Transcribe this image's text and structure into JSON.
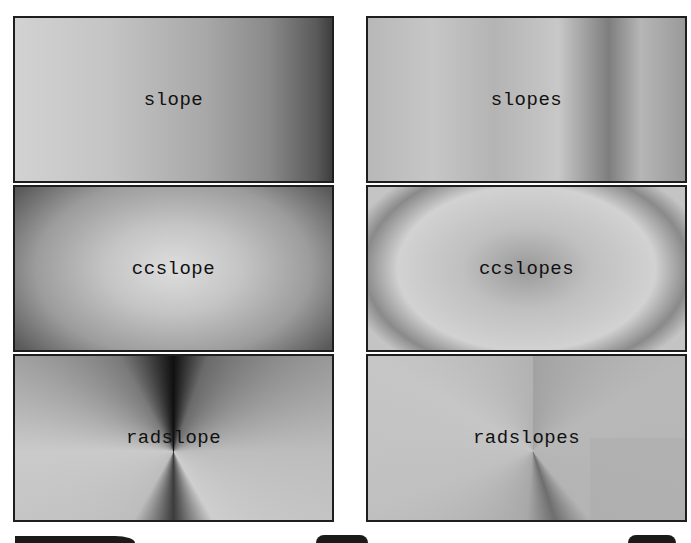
{
  "figure": {
    "layout": {
      "rows": 3,
      "columns": 2
    },
    "panels": [
      {
        "id": "slope",
        "label": "slope",
        "shading": "linear horizontal, light left to dark right"
      },
      {
        "id": "slopes",
        "label": "slopes",
        "shading": "linear horizontal, multi-stop with dark band at right third"
      },
      {
        "id": "ccslope",
        "label": "ccslope",
        "shading": "radial, light center to dark corners"
      },
      {
        "id": "ccslopes",
        "label": "ccslopes",
        "shading": "radial multi-stop, dark ring"
      },
      {
        "id": "radslope",
        "label": "radslope",
        "shading": "angular/conic around center, dark vertical seam"
      },
      {
        "id": "radslopes",
        "label": "radslopes",
        "shading": "angular multi-stop, faint dark ray below center"
      }
    ],
    "colors": {
      "border": "#1e1e1e",
      "text": "#111111",
      "background": "#ffffff"
    },
    "bottom_heading": "partially visible large dark glyph tops (cut off)"
  }
}
